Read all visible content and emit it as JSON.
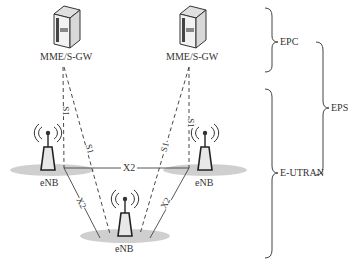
{
  "diagram": {
    "type": "LTE network architecture",
    "nodes": {
      "mme_left": {
        "label": "MME/S-GW"
      },
      "mme_right": {
        "label": "MME/S-GW"
      },
      "enb_left": {
        "label": "eNB"
      },
      "enb_right": {
        "label": "eNB"
      },
      "enb_bottom": {
        "label": "eNB"
      }
    },
    "links": {
      "s1_label": "S1",
      "x2_label": "X2",
      "edges": [
        {
          "from": "mme_left",
          "to": "enb_left",
          "type": "S1",
          "style": "dashed"
        },
        {
          "from": "mme_left",
          "to": "enb_bottom",
          "type": "S1",
          "style": "dashed"
        },
        {
          "from": "mme_right",
          "to": "enb_bottom",
          "type": "S1",
          "style": "dashed"
        },
        {
          "from": "mme_right",
          "to": "enb_right",
          "type": "S1",
          "style": "dashed"
        },
        {
          "from": "enb_left",
          "to": "enb_right",
          "type": "X2",
          "style": "solid"
        },
        {
          "from": "enb_left",
          "to": "enb_bottom",
          "type": "X2",
          "style": "solid"
        },
        {
          "from": "enb_right",
          "to": "enb_bottom",
          "type": "X2",
          "style": "solid"
        }
      ]
    },
    "groups": {
      "epc": "EPC",
      "e_utran": "E-UTRAN",
      "eps": "EPS"
    },
    "colors": {
      "line": "#333333",
      "coverage": "#c8c8c8",
      "server_dark": "#555555",
      "server_light": "#e8e8e8"
    }
  }
}
